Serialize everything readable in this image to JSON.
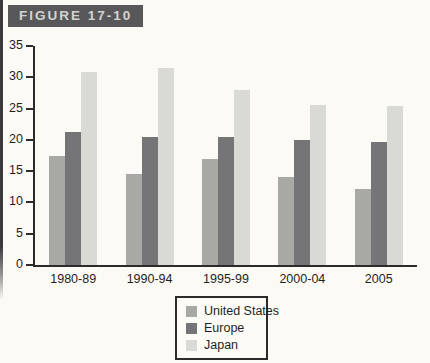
{
  "figure_label": "FIGURE 17-10",
  "colors": {
    "page_bg": "#fbfaf4",
    "label_box_bg": "#58585a",
    "label_box_text": "#d3d3d0",
    "axis": "#2b2b2b",
    "united_states": "#a8a8a5",
    "europe": "#757577",
    "japan": "#dadad4"
  },
  "chart_data": {
    "type": "bar",
    "title": "FIGURE 17-10",
    "categories": [
      "1980-89",
      "1990-94",
      "1995-99",
      "2000-04",
      "2005"
    ],
    "series": [
      {
        "name": "United States",
        "color": "#a8a8a5",
        "values": [
          17.5,
          14.5,
          17.0,
          14.0,
          12.2
        ]
      },
      {
        "name": "Europe",
        "color": "#757577",
        "values": [
          21.2,
          20.4,
          20.5,
          19.9,
          19.6
        ]
      },
      {
        "name": "Japan",
        "color": "#dadad4",
        "values": [
          30.8,
          31.5,
          28.0,
          25.5,
          25.4
        ]
      }
    ],
    "xlabel": "",
    "ylabel": "",
    "ylim": [
      0,
      35
    ],
    "yticks": [
      0,
      5,
      10,
      15,
      20,
      25,
      30,
      35
    ],
    "grid": false,
    "legend_position": "bottom-center"
  },
  "legend": {
    "items": [
      {
        "label": "United States",
        "color": "#a8a8a5"
      },
      {
        "label": "Europe",
        "color": "#757577"
      },
      {
        "label": "Japan",
        "color": "#dadad4"
      }
    ]
  }
}
